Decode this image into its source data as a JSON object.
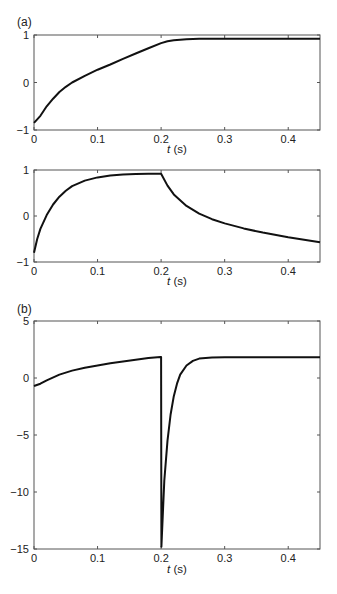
{
  "panel_labels": {
    "a": "(a)",
    "b": "(b)"
  },
  "chart_data": [
    {
      "id": "a-top",
      "type": "line",
      "panel": "(a)",
      "title": "",
      "xlabel": "t (s)",
      "ylabel": "",
      "xlim": [
        0,
        0.45
      ],
      "ylim": [
        -1,
        1
      ],
      "xticks": [
        0,
        0.1,
        0.2,
        0.3,
        0.4
      ],
      "xtick_labels": [
        "0",
        "0.1",
        "0.2",
        "0.3",
        "0.4"
      ],
      "yticks": [
        -1,
        0,
        1
      ],
      "ytick_labels": [
        "−1",
        "0",
        "1"
      ],
      "grid": false,
      "series": [
        {
          "name": "response",
          "x": [
            0,
            0.01,
            0.02,
            0.03,
            0.04,
            0.05,
            0.06,
            0.08,
            0.1,
            0.12,
            0.14,
            0.16,
            0.18,
            0.2,
            0.21,
            0.22,
            0.24,
            0.26,
            0.3,
            0.35,
            0.4,
            0.45
          ],
          "y": [
            -0.85,
            -0.7,
            -0.5,
            -0.34,
            -0.2,
            -0.09,
            0.0,
            0.14,
            0.27,
            0.38,
            0.5,
            0.61,
            0.72,
            0.83,
            0.87,
            0.89,
            0.91,
            0.92,
            0.92,
            0.92,
            0.92,
            0.92
          ]
        }
      ]
    },
    {
      "id": "a-bottom",
      "type": "line",
      "panel": "(a)",
      "title": "",
      "xlabel": "t (s)",
      "ylabel": "",
      "xlim": [
        0,
        0.45
      ],
      "ylim": [
        -1,
        1
      ],
      "xticks": [
        0,
        0.1,
        0.2,
        0.3,
        0.4
      ],
      "xtick_labels": [
        "0",
        "0.1",
        "0.2",
        "0.3",
        "0.4"
      ],
      "yticks": [
        -1,
        0,
        1
      ],
      "ytick_labels": [
        "−1",
        "0",
        "1"
      ],
      "grid": false,
      "series": [
        {
          "name": "response",
          "x": [
            0,
            0.005,
            0.01,
            0.02,
            0.03,
            0.04,
            0.05,
            0.06,
            0.08,
            0.1,
            0.12,
            0.14,
            0.16,
            0.18,
            0.2,
            0.21,
            0.22,
            0.24,
            0.26,
            0.28,
            0.3,
            0.33,
            0.36,
            0.4,
            0.45
          ],
          "y": [
            -0.8,
            -0.5,
            -0.28,
            0.02,
            0.25,
            0.42,
            0.55,
            0.65,
            0.77,
            0.84,
            0.88,
            0.9,
            0.91,
            0.92,
            0.92,
            0.66,
            0.47,
            0.22,
            0.05,
            -0.07,
            -0.16,
            -0.27,
            -0.36,
            -0.46,
            -0.57
          ]
        }
      ]
    },
    {
      "id": "b",
      "type": "line",
      "panel": "(b)",
      "title": "",
      "xlabel": "t (s)",
      "ylabel": "",
      "xlim": [
        0,
        0.45
      ],
      "ylim": [
        -15,
        5
      ],
      "xticks": [
        0,
        0.1,
        0.2,
        0.3,
        0.4
      ],
      "xtick_labels": [
        "0",
        "0.1",
        "0.2",
        "0.3",
        "0.4"
      ],
      "yticks": [
        -15,
        -10,
        -5,
        0,
        5
      ],
      "ytick_labels": [
        "−15",
        "−10",
        "−5",
        "0",
        "5"
      ],
      "grid": false,
      "series": [
        {
          "name": "response",
          "x": [
            0,
            0.01,
            0.02,
            0.04,
            0.06,
            0.08,
            0.1,
            0.12,
            0.14,
            0.16,
            0.18,
            0.199,
            0.2,
            0.2005,
            0.205,
            0.21,
            0.215,
            0.22,
            0.225,
            0.23,
            0.24,
            0.25,
            0.26,
            0.28,
            0.3,
            0.35,
            0.4,
            0.45
          ],
          "y": [
            -0.7,
            -0.5,
            -0.2,
            0.3,
            0.65,
            0.9,
            1.1,
            1.3,
            1.45,
            1.6,
            1.75,
            1.85,
            1.85,
            -14.8,
            -9.0,
            -5.5,
            -3.2,
            -1.6,
            -0.5,
            0.3,
            1.1,
            1.5,
            1.7,
            1.8,
            1.82,
            1.82,
            1.82,
            1.82
          ]
        }
      ]
    }
  ]
}
